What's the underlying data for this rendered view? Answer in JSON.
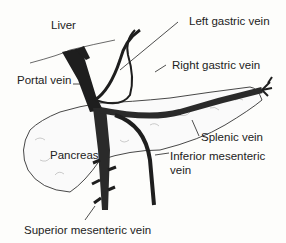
{
  "diagram": {
    "type": "anatomical-illustration",
    "labels": {
      "liver": "Liver",
      "portal_vein": "Portal vein",
      "left_gastric_vein": "Left gastric vein",
      "right_gastric_vein": "Right gastric vein",
      "splenic_vein": "Splenic vein",
      "pancreas": "Pancreas",
      "inferior_mesenteric_vein_1": "Inferior mesenteric",
      "inferior_mesenteric_vein_2": "vein",
      "superior_mesenteric_vein": "Superior mesenteric vein"
    },
    "colors": {
      "vein": "#1e1e1e",
      "outline": "#333333",
      "background": "#fdfdfb"
    }
  }
}
